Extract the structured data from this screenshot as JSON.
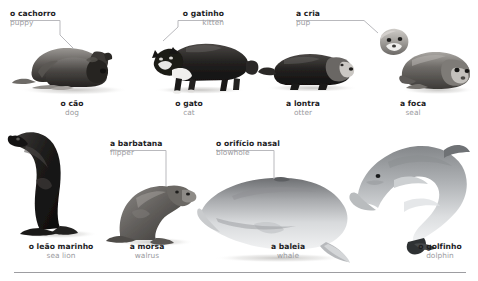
{
  "page": {
    "background": "#ffffff",
    "width": 478,
    "height": 281,
    "pt_color": "#1d1d1f",
    "en_color": "#9a9a9e",
    "leader_color": "#b9b9bd",
    "rule_color": "#9d9da1"
  },
  "callouts": [
    {
      "id": "puppy",
      "pt": "o cachorro",
      "en": "puppy"
    },
    {
      "id": "kitten",
      "pt": "o gatinho",
      "en": "kitten"
    },
    {
      "id": "pup",
      "pt": "a cria",
      "en": "pup"
    },
    {
      "id": "flipper",
      "pt": "a barbatana",
      "en": "flipper"
    },
    {
      "id": "blowhole",
      "pt": "o orifício nasal",
      "en": "blowhole"
    }
  ],
  "captions_top": [
    {
      "id": "dog",
      "pt": "o cão",
      "en": "dog"
    },
    {
      "id": "cat",
      "pt": "o gato",
      "en": "cat"
    },
    {
      "id": "otter",
      "pt": "a lontra",
      "en": "otter"
    },
    {
      "id": "seal",
      "pt": "a foca",
      "en": "seal"
    }
  ],
  "captions_bottom": [
    {
      "id": "sea-lion",
      "pt": "o leão marinho",
      "en": "sea lion"
    },
    {
      "id": "walrus",
      "pt": "a morsa",
      "en": "walrus"
    },
    {
      "id": "whale",
      "pt": "a baleia",
      "en": "whale"
    },
    {
      "id": "dolphin",
      "pt": "o golfinho",
      "en": "dolphin"
    }
  ],
  "animals": [
    {
      "id": "dog-photo",
      "alt": "two puppies lying down"
    },
    {
      "id": "cat-photo",
      "alt": "black and white cat walking"
    },
    {
      "id": "otter-photo",
      "alt": "otter lying on ground"
    },
    {
      "id": "seal-photo",
      "alt": "seal resting"
    },
    {
      "id": "seal-pup-photo",
      "alt": "seal pup head"
    },
    {
      "id": "sea-lion-photo",
      "alt": "sea lion upright"
    },
    {
      "id": "walrus-photo",
      "alt": "walrus sitting"
    },
    {
      "id": "whale-photo",
      "alt": "whale side view"
    },
    {
      "id": "dolphin-photo",
      "alt": "dolphin leaping"
    }
  ]
}
